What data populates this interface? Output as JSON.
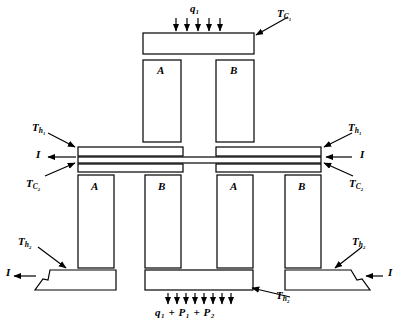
{
  "figure": {
    "type": "two-stage-thermoelectric-cooler-cross-section",
    "legs": {
      "upper_stage": [
        {
          "label": "A",
          "x": 143,
          "y": 60,
          "w": 38,
          "h": 82
        },
        {
          "label": "B",
          "x": 216,
          "y": 60,
          "w": 38,
          "h": 82
        }
      ],
      "lower_stage": [
        {
          "label": "A",
          "x": 78,
          "y": 175,
          "w": 36,
          "h": 93
        },
        {
          "label": "B",
          "x": 145,
          "y": 175,
          "w": 36,
          "h": 93
        },
        {
          "label": "A",
          "x": 217,
          "y": 175,
          "w": 36,
          "h": 93
        },
        {
          "label": "B",
          "x": 285,
          "y": 175,
          "w": 36,
          "h": 93
        }
      ]
    },
    "temperatures": [
      {
        "name": "T_C1",
        "base": "T",
        "sub": "C₁",
        "text": "TC₁",
        "x": 277,
        "y": 8,
        "position": "top-right"
      },
      {
        "name": "T_h1-left",
        "base": "T",
        "sub": "h₁",
        "text": "Th₁",
        "x": 32,
        "y": 122,
        "position": "middle-left-upper"
      },
      {
        "name": "T_C2-left",
        "base": "T",
        "sub": "C₂",
        "text": "TC₂",
        "x": 26,
        "y": 178,
        "position": "middle-left-lower"
      },
      {
        "name": "T_h1-right",
        "base": "T",
        "sub": "h₁",
        "text": "Th₁",
        "x": 348,
        "y": 122,
        "position": "middle-right-upper"
      },
      {
        "name": "T_C2-right",
        "base": "T",
        "sub": "C₂",
        "text": "TC₂",
        "x": 349,
        "y": 178,
        "position": "middle-right-lower"
      },
      {
        "name": "T_h2-left",
        "base": "T",
        "sub": "h₂",
        "text": "Th₂",
        "x": 18,
        "y": 236,
        "position": "bottom-left"
      },
      {
        "name": "T_h2-right",
        "base": "T",
        "sub": "h₂",
        "text": "Th₂",
        "x": 352,
        "y": 236,
        "position": "bottom-right"
      },
      {
        "name": "T_h2-center",
        "base": "T",
        "sub": "h₂",
        "text": "Th₂",
        "x": 276,
        "y": 290,
        "position": "bottom-center"
      }
    ],
    "currents": [
      {
        "name": "current-left-middle",
        "text": "I",
        "x": 36,
        "y": 149,
        "direction": "left"
      },
      {
        "name": "current-right-middle",
        "text": "I",
        "x": 360,
        "y": 149,
        "direction": "right-inward"
      },
      {
        "name": "current-left-bottom",
        "text": "I",
        "x": 6,
        "y": 267,
        "direction": "left"
      },
      {
        "name": "current-right-bottom",
        "text": "I",
        "x": 388,
        "y": 267,
        "direction": "right-inward"
      }
    ],
    "heat_flux": {
      "top": {
        "name": "q1",
        "text": "q₁",
        "x": 190,
        "y": 3,
        "arrow_direction": "down",
        "arrow_count": 5
      },
      "bottom": {
        "name": "q1-p1-p2",
        "text": "q₁ + P₁ + P₂",
        "x": 155,
        "y": 307,
        "arrow_direction": "down",
        "arrow_count": 8
      }
    },
    "colors": {
      "stroke": "#000000",
      "fill": "#ffffff",
      "background": "#ffffff"
    }
  }
}
